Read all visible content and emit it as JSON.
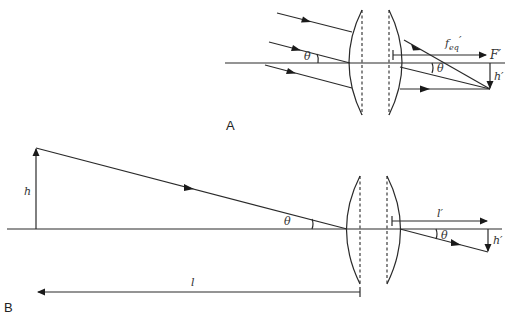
{
  "figure": {
    "panels": [
      {
        "id": "A",
        "label": "A",
        "description": "Parallel rays inclined at angle theta converge through a two-element plano-convex lens to a point at height h' below the focal point F'",
        "symbols": {
          "theta_in": "θ",
          "theta_out": "θ",
          "f_eq_main": "f",
          "f_eq_sub": "eq",
          "f_eq_prime": "′",
          "focal_point": "F′",
          "image_height": "h′"
        }
      },
      {
        "id": "B",
        "label": "B",
        "description": "Object of height h at distance l imaged by the lens pair to image height h' at distance l'",
        "symbols": {
          "object_height": "h",
          "theta_in": "θ",
          "theta_out": "θ",
          "object_distance": "l",
          "image_distance": "l′",
          "image_height": "h′"
        }
      }
    ],
    "colors": {
      "line": "#2a2a2a",
      "background": "#ffffff"
    }
  }
}
